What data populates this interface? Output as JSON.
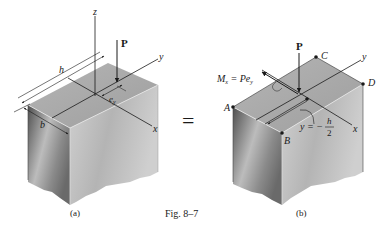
{
  "figure": {
    "caption": "Fig. 8–7",
    "equals_sign": "="
  },
  "panel_a": {
    "sublabel": "(a)",
    "labels": {
      "z_axis": "z",
      "y_axis": "y",
      "x_axis": "x",
      "force": "P",
      "height_dim": "h",
      "width_dim": "b",
      "eccentricity": "e",
      "eccentricity_sub": "y"
    }
  },
  "panel_b": {
    "sublabel": "(b)",
    "labels": {
      "force": "P",
      "moment_M": "M",
      "moment_sub": "x",
      "moment_eq": " = Pe",
      "moment_eq_sub": "y",
      "y_axis": "y",
      "x_axis": "x",
      "corner_A": "A",
      "corner_B": "B",
      "corner_C": "C",
      "corner_D": "D",
      "y_eq": "y = −",
      "h": "h",
      "two": "2"
    }
  },
  "colors": {
    "top_face": "#a9a9a9",
    "left_face_dark": "#5e5e5e",
    "left_face_light": "#c4c4c4",
    "right_face": "#bdbdbd",
    "line": "#1a1a1a"
  }
}
